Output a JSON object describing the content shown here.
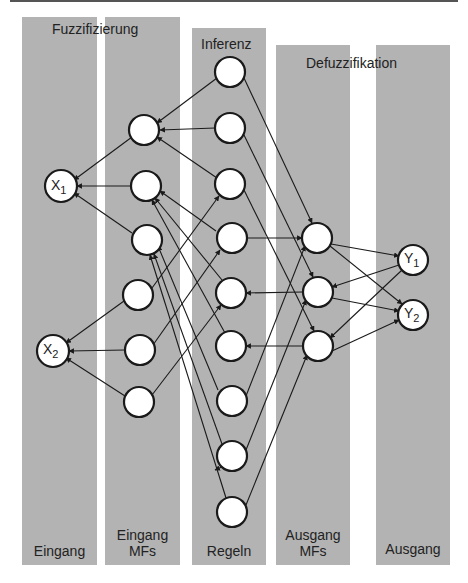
{
  "diagram": {
    "stage_headers": {
      "fuzzification": "Fuzzifizierung",
      "inference": "Inferenz",
      "defuzzification": "Defuzzifikation"
    },
    "columns": [
      {
        "id": "input",
        "label": "Eingang"
      },
      {
        "id": "input_mfs",
        "label_line1": "Eingang",
        "label_line2": "MFs"
      },
      {
        "id": "rules",
        "label": "Regeln"
      },
      {
        "id": "output_mfs",
        "label_line1": "Ausgang",
        "label_line2": "MFs"
      },
      {
        "id": "output",
        "label": "Ausgang"
      }
    ],
    "nodes": {
      "inputs": [
        {
          "label": "X",
          "sub": "1"
        },
        {
          "label": "X",
          "sub": "2"
        }
      ],
      "outputs": [
        {
          "label": "Y",
          "sub": "1"
        },
        {
          "label": "Y",
          "sub": "2"
        }
      ],
      "input_mf_count": 6,
      "rule_count": 9,
      "output_mf_count": 3
    },
    "colors": {
      "band": "#b3b3b3",
      "node_fill": "#ffffff",
      "node_stroke": "#1a1a1a",
      "edge": "#1a1a1a"
    }
  }
}
